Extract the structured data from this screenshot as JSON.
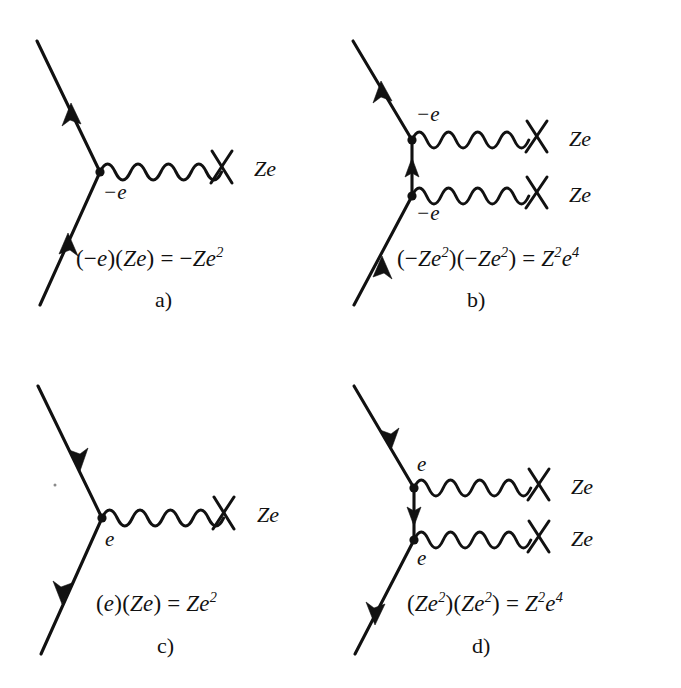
{
  "figure": {
    "type": "feynman-diagram-set",
    "background_color": "#ffffff",
    "ink_color": "#111111",
    "panel_count": 4,
    "columns": 2,
    "rows": 2
  },
  "panels": [
    {
      "id": "a",
      "caption": "a)",
      "formula": {
        "full": "(−e)(Ze) = −Ze²",
        "open1": "(−",
        "factor1": "e",
        "close1": ")(",
        "factor2_Z": "Z",
        "factor2_e": "e",
        "close2": ") = −",
        "result_Z": "Z",
        "result_e": "e",
        "result_exp": "2"
      },
      "vertex_labels": [
        {
          "text": "−e",
          "name": "vertex-charge-label-minus-e"
        }
      ],
      "source_labels": [
        {
          "text": "Ze",
          "name": "source-charge-label-ze"
        }
      ],
      "photon_count": 1,
      "fermion_arrow_direction": "up",
      "description": "single photon exchange, electron charge minus e"
    },
    {
      "id": "b",
      "caption": "b)",
      "formula": {
        "full": "(−Ze²)(−Ze²) = Z²e⁴",
        "open1": "(−",
        "f1_Z": "Z",
        "f1_e": "e",
        "f1_exp": "2",
        "mid": ")(−",
        "f2_Z": "Z",
        "f2_e": "e",
        "f2_exp": "2",
        "close": ") = ",
        "result_Z": "Z",
        "result_Z_exp": "2",
        "result_e": "e",
        "result_e_exp": "4"
      },
      "vertex_labels": [
        {
          "text": "−e",
          "name": "upper-vertex-charge-label-minus-e"
        },
        {
          "text": "−e",
          "name": "lower-vertex-charge-label-minus-e"
        }
      ],
      "source_labels": [
        {
          "text": "Ze",
          "name": "upper-source-charge-label-ze"
        },
        {
          "text": "Ze",
          "name": "lower-source-charge-label-ze"
        }
      ],
      "photon_count": 2,
      "fermion_arrow_direction": "up",
      "internal_arrow_direction": "up",
      "description": "two photon exchange, electron charge minus e at each vertex"
    },
    {
      "id": "c",
      "caption": "c)",
      "formula": {
        "full": "(e)(Ze) = Ze²",
        "open1": "(",
        "factor1": "e",
        "close1": ")(",
        "factor2_Z": "Z",
        "factor2_e": "e",
        "close2": ") = ",
        "result_Z": "Z",
        "result_e": "e",
        "result_exp": "2"
      },
      "vertex_labels": [
        {
          "text": "e",
          "name": "vertex-charge-label-e"
        }
      ],
      "source_labels": [
        {
          "text": "Ze",
          "name": "source-charge-label-ze"
        }
      ],
      "photon_count": 1,
      "fermion_arrow_direction": "down",
      "description": "single photon exchange, positron charge e"
    },
    {
      "id": "d",
      "caption": "d)",
      "formula": {
        "full": "(Ze²)(Ze²) = Z²e⁴",
        "open1": "(",
        "f1_Z": "Z",
        "f1_e": "e",
        "f1_exp": "2",
        "mid": ")(",
        "f2_Z": "Z",
        "f2_e": "e",
        "f2_exp": "2",
        "close": ") = ",
        "result_Z": "Z",
        "result_Z_exp": "2",
        "result_e": "e",
        "result_e_exp": "4"
      },
      "vertex_labels": [
        {
          "text": "e",
          "name": "upper-vertex-charge-label-e"
        },
        {
          "text": "e",
          "name": "lower-vertex-charge-label-e"
        }
      ],
      "source_labels": [
        {
          "text": "Ze",
          "name": "upper-source-charge-label-ze"
        },
        {
          "text": "Ze",
          "name": "lower-source-charge-label-ze"
        }
      ],
      "photon_count": 2,
      "fermion_arrow_direction": "down",
      "internal_arrow_direction": "down",
      "description": "two photon exchange, positron charge e at each vertex"
    }
  ]
}
